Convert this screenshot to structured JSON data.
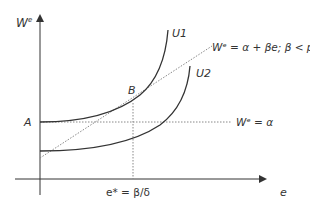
{
  "diagram": {
    "y_axis_label": "W",
    "y_axis_sup": "e",
    "x_axis_label": "e",
    "point_A": "A",
    "point_B": "B",
    "curve_U1": "U1",
    "curve_U2": "U2",
    "line_wage_rule": "Wᵉ = α + βe; β < p",
    "line_flat_wage": "Wᵉ = α",
    "e_star_label": "e* = β/δ"
  },
  "colors": {
    "line": "#333333",
    "dotted": "#777777"
  }
}
